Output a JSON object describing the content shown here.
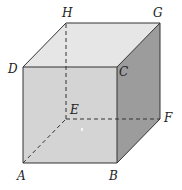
{
  "diagram": {
    "type": "cube",
    "vertices": {
      "A": {
        "label": "A",
        "x": 23,
        "y": 163
      },
      "B": {
        "label": "B",
        "x": 117,
        "y": 163
      },
      "C": {
        "label": "C",
        "x": 117,
        "y": 67
      },
      "D": {
        "label": "D",
        "x": 23,
        "y": 67
      },
      "E": {
        "label": "E",
        "x": 66,
        "y": 119
      },
      "F": {
        "label": "F",
        "x": 160,
        "y": 119
      },
      "G": {
        "label": "G",
        "x": 160,
        "y": 23
      },
      "H": {
        "label": "H",
        "x": 66,
        "y": 23
      }
    },
    "hidden_edges": [
      "AE",
      "EF",
      "EH"
    ],
    "colors": {
      "front_face": "#d6d6d6",
      "top_face": "#e8e8e8",
      "right_face": "#9a9a9a",
      "edge": "#333333"
    }
  }
}
